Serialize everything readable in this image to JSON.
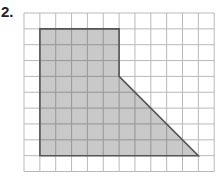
{
  "problem": {
    "label": "2."
  },
  "diagram": {
    "type": "grid-polygon",
    "grid": {
      "columns": 12,
      "rows": 10,
      "origin_px": [
        24,
        13
      ],
      "cell_px": 15.85,
      "line_color": "#b9b9b9"
    },
    "shape": {
      "vertices_grid": [
        [
          1,
          1
        ],
        [
          6,
          1
        ],
        [
          6,
          4
        ],
        [
          11,
          9
        ],
        [
          1,
          9
        ]
      ],
      "fill": "#c9c9c9",
      "stroke": "#555555",
      "inner_grid_color": "#9a9a9a"
    }
  }
}
